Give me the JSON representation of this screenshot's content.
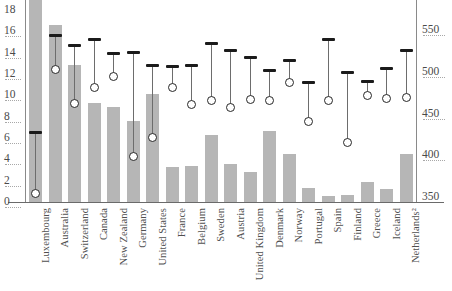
{
  "chart_data": {
    "type": "bar",
    "title": "",
    "subtitle": "",
    "xlabel": "",
    "ylabel": "",
    "y2label": "",
    "grid": false,
    "legend_position": "none",
    "categories": [
      "Luxembourg",
      "Australia",
      "Switzerland",
      "Canada",
      "New Zealand",
      "Germany",
      "United States",
      "France",
      "Belgium",
      "Sweden",
      "Austria",
      "United Kingdom",
      "Denmark",
      "Norway",
      "Portugal",
      "Spain",
      "Finland",
      "Greece",
      "Iceland",
      "Netherlands²"
    ],
    "left_axis": {
      "min": 0,
      "max": 18,
      "ticks": [
        0,
        2,
        4,
        6,
        8,
        10,
        12,
        14,
        16,
        18
      ],
      "tick_labels": [
        "0",
        "2",
        "4",
        "6",
        "8",
        "10",
        "12",
        "14",
        "16",
        "18"
      ]
    },
    "right_axis": {
      "min": 350,
      "max": 550,
      "ticks": [
        350,
        400,
        450,
        500,
        550
      ],
      "tick_labels": [
        "350",
        "400",
        "450",
        "500",
        "550"
      ]
    },
    "series": [
      {
        "name": "bars",
        "axis": "left",
        "color": "#b6b6b6",
        "values": [
          19.1,
          16.6,
          12.8,
          9.3,
          8.9,
          7.6,
          10.1,
          3.3,
          3.4,
          6.3,
          3.6,
          2.8,
          6.7,
          4.5,
          1.3,
          0.6,
          0.7,
          1.9,
          1.2,
          4.5
        ]
      },
      {
        "name": "range-high",
        "axis": "right",
        "color": "#1b1b1b",
        "values": [
          427,
          544,
          531,
          539,
          522,
          523,
          508,
          506,
          508,
          534,
          526,
          517,
          502,
          513,
          487,
          539,
          499,
          488,
          504,
          525
        ]
      },
      {
        "name": "range-low",
        "axis": "right",
        "color": "#ffffff",
        "values": [
          354,
          503,
          462,
          481,
          494,
          399,
          421,
          481,
          461,
          465,
          457,
          467,
          466,
          487,
          441,
          466,
          415,
          472,
          468,
          469
        ]
      }
    ]
  }
}
